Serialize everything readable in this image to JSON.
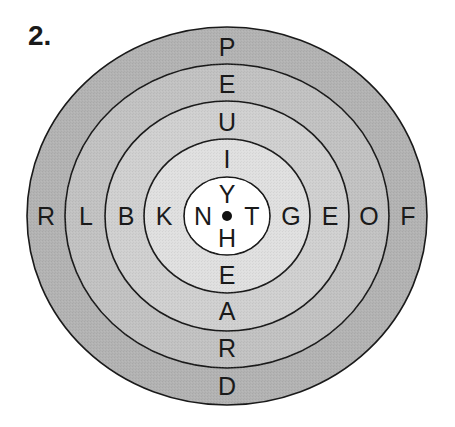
{
  "puzzle": {
    "number_label": "2.",
    "center": {
      "cx": 227,
      "cy": 216
    },
    "rings": [
      {
        "name": "ring-1-outer",
        "rx": 200,
        "ry": 189,
        "fill": "#b3b3b3"
      },
      {
        "name": "ring-2",
        "rx": 162,
        "ry": 152,
        "fill": "#c2c2c2"
      },
      {
        "name": "ring-3",
        "rx": 122,
        "ry": 115,
        "fill": "#d0d0d0"
      },
      {
        "name": "ring-4",
        "rx": 83,
        "ry": 77,
        "fill": "#e0e0e0"
      },
      {
        "name": "ring-5-center",
        "rx": 43,
        "ry": 39,
        "fill": "#ffffff"
      }
    ],
    "stroke_color": "#1a1a1a",
    "center_dot_color": "#111111",
    "letters": {
      "vertical_top": [
        "P",
        "E",
        "U",
        "I",
        "Y"
      ],
      "vertical_bottom": [
        "H",
        "E",
        "A",
        "R",
        "D"
      ],
      "horizontal_left": [
        "R",
        "L",
        "B",
        "K",
        "N"
      ],
      "horizontal_right": [
        "T",
        "G",
        "E",
        "O",
        "F"
      ]
    },
    "letter_positions": [
      {
        "char": "P",
        "x": 227,
        "y": 47
      },
      {
        "char": "E",
        "x": 227,
        "y": 84
      },
      {
        "char": "U",
        "x": 227,
        "y": 122
      },
      {
        "char": "I",
        "x": 227,
        "y": 159
      },
      {
        "char": "Y",
        "x": 227,
        "y": 194
      },
      {
        "char": "H",
        "x": 227,
        "y": 238
      },
      {
        "char": "E",
        "x": 227,
        "y": 275
      },
      {
        "char": "A",
        "x": 227,
        "y": 311
      },
      {
        "char": "R",
        "x": 227,
        "y": 348
      },
      {
        "char": "D",
        "x": 227,
        "y": 386
      },
      {
        "char": "R",
        "x": 46,
        "y": 216
      },
      {
        "char": "L",
        "x": 86,
        "y": 216
      },
      {
        "char": "B",
        "x": 126,
        "y": 216
      },
      {
        "char": "K",
        "x": 164,
        "y": 216
      },
      {
        "char": "N",
        "x": 203,
        "y": 216
      },
      {
        "char": "T",
        "x": 252,
        "y": 216
      },
      {
        "char": "G",
        "x": 291,
        "y": 216
      },
      {
        "char": "E",
        "x": 330,
        "y": 216
      },
      {
        "char": "O",
        "x": 369,
        "y": 216
      },
      {
        "char": "F",
        "x": 408,
        "y": 216
      }
    ]
  }
}
